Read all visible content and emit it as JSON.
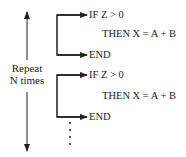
{
  "repeat_label": {
    "line1": "Repeat",
    "line2": "N times"
  },
  "blocks": [
    {
      "if": "IF Z > 0",
      "then": "THEN X = A + B",
      "end": "END"
    },
    {
      "if": "IF Z > 0",
      "then": "THEN X = A + B",
      "end": "END"
    }
  ],
  "continuation": "⋮",
  "colors": {
    "line": "#222222",
    "background": "#ffffff"
  }
}
